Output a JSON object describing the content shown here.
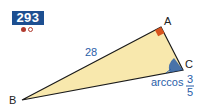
{
  "exercise": {
    "number": "293",
    "difficulty": {
      "filled": 1,
      "total": 2
    }
  },
  "diagram": {
    "vertices": {
      "A": {
        "label": "A",
        "x": 161,
        "y": 27
      },
      "B": {
        "label": "B",
        "x": 22,
        "y": 100
      },
      "C": {
        "label": "C",
        "x": 183,
        "y": 70
      }
    },
    "side_AB_label": "28",
    "right_angle_at": "A",
    "angle_C_label": {
      "prefix": "arccos",
      "numerator": "3",
      "denominator": "5"
    },
    "colors": {
      "fill": "#f8e8ad",
      "stroke": "#1a1a1a",
      "right_angle_mark": "#d9541e",
      "angle_arc": "#2a5ea8",
      "label_blue": "#2a5ea8",
      "badge": "#1d4f91"
    }
  }
}
